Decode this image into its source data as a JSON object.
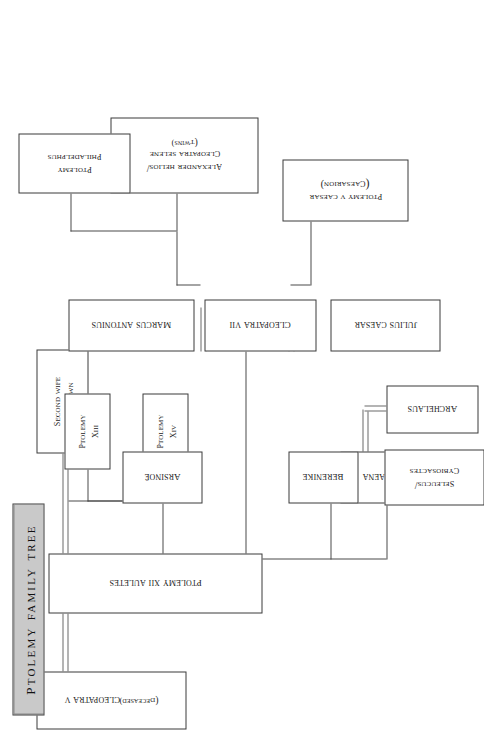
{
  "title": {
    "text": "Ptolemy Family Tree"
  },
  "nodes": {
    "second_wife": {
      "lines": [
        "Second wife",
        "unknown"
      ]
    },
    "ptolemy_xiv": {
      "lines": [
        "Ptolemy",
        "XIV"
      ]
    },
    "ptolemy_xiii": {
      "lines": [
        "Ptolemy",
        "XIII"
      ]
    },
    "ptolemy_xii": {
      "lines": [
        "Ptolemy XII Auletes"
      ]
    },
    "cleopatra_v": {
      "lines": [
        "Cleopatra V"
      ],
      "sublines": [
        "(deceased)"
      ]
    },
    "tryphaena": {
      "lines": [
        "Tryphaena"
      ]
    },
    "berenike": {
      "lines": [
        "Berenike"
      ]
    },
    "seleucus": {
      "lines": [
        "Seleucus/",
        "Cybiosactes"
      ]
    },
    "archelaus": {
      "lines": [
        "Archelaus"
      ]
    },
    "arsinoe": {
      "lines": [
        "Arsinoë"
      ]
    },
    "cleopatra_vii": {
      "lines": [
        "Cleopatra VII"
      ]
    },
    "julius_caesar": {
      "lines": [
        "Julius Caesar"
      ]
    },
    "caesarion": {
      "lines": [
        "Ptolemy V Caesar",
        "(Caesarion)"
      ]
    },
    "marcus_antonius": {
      "lines": [
        "Marcus Antonius"
      ]
    },
    "twins": {
      "lines": [
        "Alexander Helios/",
        "Cleopatra Selene"
      ],
      "sublines": [
        "(twins)"
      ]
    },
    "ptolemy_philadelphus": {
      "lines": [
        "Ptolemy",
        "Philadelphus"
      ]
    }
  },
  "colors": {
    "title_plaque": "#c9c9c9",
    "node_border": "#3a3a3a",
    "connector": "#4a4a4a",
    "marriage_bar": "#6b6b6b",
    "background": "#ffffff"
  }
}
